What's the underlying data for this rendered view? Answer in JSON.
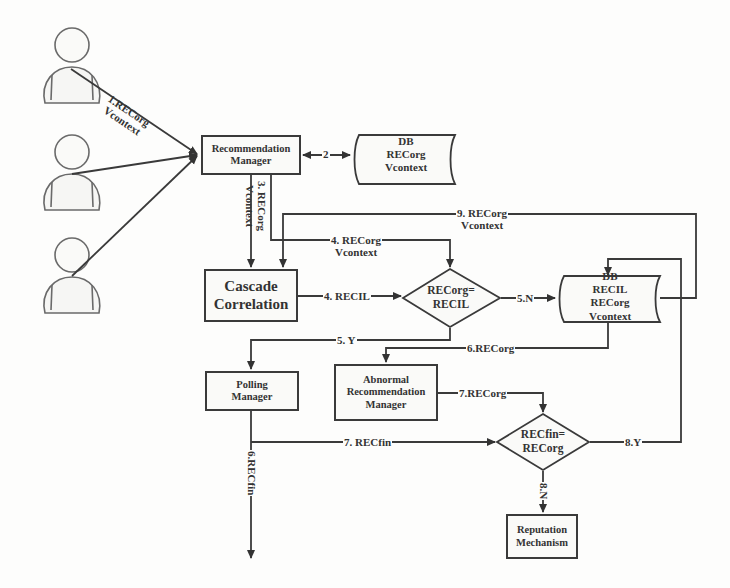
{
  "users": [
    {
      "name": "user-1"
    },
    {
      "name": "user-2"
    },
    {
      "name": "user-3"
    }
  ],
  "nodes": {
    "recommendation_manager": {
      "line1": "Recommendation",
      "line2": "Manager"
    },
    "db1": {
      "line1": "DB",
      "line2": "RECorg",
      "line3": "Vcontext"
    },
    "cascade_correlation": {
      "line1": "Cascade",
      "line2": "Correlation"
    },
    "decision1": {
      "line1": "RECorg=",
      "line2": "RECIL"
    },
    "db2": {
      "line1": "DB",
      "line2": "RECIL",
      "line3": "RECorg",
      "line4": "Vcontext"
    },
    "polling_manager": {
      "line1": "Polling",
      "line2": "Manager"
    },
    "abnormal_manager": {
      "line1": "Abnormal",
      "line2": "Recommendation",
      "line3": "Manager"
    },
    "decision2": {
      "line1": "RECfin=",
      "line2": "RECorg"
    },
    "reputation_mechanism": {
      "line1": "Reputation",
      "line2": "Mechanism"
    }
  },
  "edges": {
    "e1": {
      "line1": "1.RECorg",
      "line2": "Vcontext"
    },
    "e2": {
      "label": "2"
    },
    "e3": {
      "line1": "3. RECorg",
      "line2": "Vcontext"
    },
    "e4a": {
      "line1": "4. RECorg",
      "line2": "Vcontext"
    },
    "e4b": {
      "label": "4. RECIL"
    },
    "e5n": {
      "label": "5.N"
    },
    "e5y": {
      "label": "5. Y"
    },
    "e6": {
      "label": "6.RECorg"
    },
    "e6fin": {
      "label": "6.RECfin"
    },
    "e7org": {
      "label": "7.RECorg"
    },
    "e7fin": {
      "label": "7. RECfin"
    },
    "e8y": {
      "label": "8.Y"
    },
    "e8n": {
      "label": "8.N"
    },
    "e9": {
      "line1": "9. RECorg",
      "line2": "Vcontext"
    }
  },
  "colors": {
    "stroke": "#3a3a3a",
    "text": "#333333",
    "background": "#fdfdfc",
    "user_stroke": "#6a6a6a"
  }
}
